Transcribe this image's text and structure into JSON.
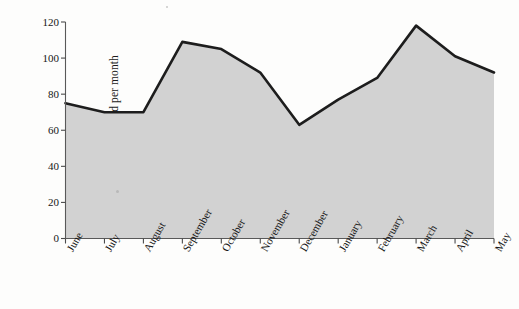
{
  "chart_data": {
    "type": "area",
    "title": "",
    "subtitle": "",
    "xlabel": "",
    "ylabel": "Analyst Demand per month",
    "categories": [
      "June",
      "July",
      "August",
      "September",
      "October",
      "November",
      "December",
      "January",
      "February",
      "March",
      "April",
      "May"
    ],
    "values": [
      75,
      70,
      70,
      109,
      105,
      92,
      63,
      77,
      89,
      118,
      101,
      92
    ],
    "series": [
      {
        "name": "Analyst Demand per month",
        "values": [
          75,
          70,
          70,
          109,
          105,
          92,
          63,
          77,
          89,
          118,
          101,
          92
        ]
      }
    ],
    "ylim": [
      0,
      120
    ],
    "yticks": [
      0,
      20,
      40,
      60,
      80,
      100,
      120
    ],
    "ytick_labels": [
      "0",
      "20",
      "40",
      "60",
      "80",
      "100",
      "120"
    ],
    "grid": false,
    "legend": false,
    "legend_position": "none",
    "fill_color": "#d2d2d2",
    "line_color": "#1d1d1d",
    "axis_color": "#4b4b4b",
    "background_color": "#fdfdfc"
  }
}
